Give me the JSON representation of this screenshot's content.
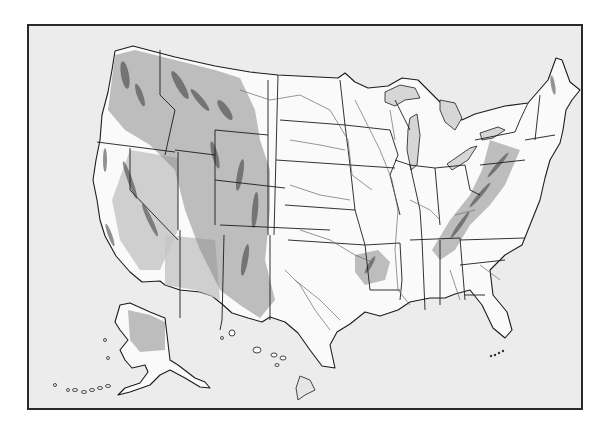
{
  "map": {
    "title": "",
    "type": "shaded-relief outline map",
    "subject": "United States of America",
    "regions_shown": [
      "Contiguous United States",
      "Alaska",
      "Hawaii",
      "Florida Keys"
    ],
    "features": {
      "state_borders": true,
      "rivers": true,
      "great_lakes": true,
      "relief_shading": [
        "Pacific Coast Ranges",
        "Sierra Nevada",
        "Great Basin",
        "Rocky Mountains",
        "Colorado Plateau",
        "Ozark Plateau",
        "Appalachian Mountains",
        "Alaska Range",
        "Hawaii volcanoes"
      ],
      "labels": false
    },
    "colors": {
      "background": "#ececec",
      "land": "#fafafa",
      "outline": "#1c1c1c",
      "river": "#6a6a6a",
      "relief": "#8a8a8a",
      "frame": "#2a2a2a"
    }
  }
}
